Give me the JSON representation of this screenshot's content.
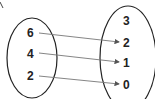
{
  "diagram": {
    "type": "mapping",
    "domain": {
      "values": [
        "6",
        "4",
        "2"
      ]
    },
    "range": {
      "values": [
        "3",
        "2",
        "1",
        "0"
      ]
    },
    "mappings": [
      {
        "from": "6",
        "to": "2"
      },
      {
        "from": "4",
        "to": "1"
      },
      {
        "from": "2",
        "to": "0"
      }
    ],
    "colors": {
      "stroke": "#222222",
      "arrow": "#666666"
    }
  }
}
